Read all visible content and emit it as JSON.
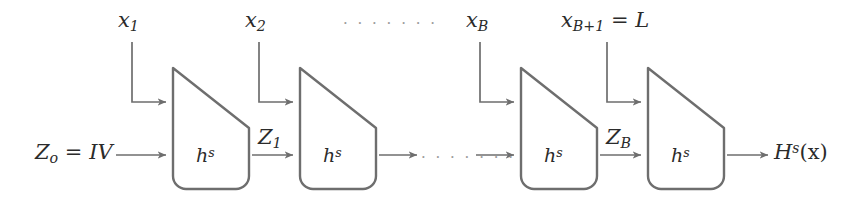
{
  "figure": {
    "background_color": "#ffffff",
    "stroke_color": "#6e6e6e",
    "text_color": "#2b2b2b",
    "dots_color": "#9a9a9a"
  },
  "blocks": [
    {
      "label_base": "h",
      "label_sup": "s"
    },
    {
      "label_base": "h",
      "label_sup": "s"
    },
    {
      "label_base": "h",
      "label_sup": "s"
    },
    {
      "label_base": "h",
      "label_sup": "s"
    }
  ],
  "top_inputs": [
    {
      "base": "x",
      "sub": "1"
    },
    {
      "base": "x",
      "sub": "2"
    },
    {
      "base": "x",
      "sub": "B"
    },
    {
      "base": "x",
      "sub": "B+1",
      "equals": " = ",
      "value": "L"
    }
  ],
  "state_labels": {
    "initial_base": "Z",
    "initial_sub": "o",
    "initial_equals": " = ",
    "initial_value": "IV",
    "z1_base": "Z",
    "z1_sub": "1",
    "zb_base": "Z",
    "zb_sub": "B"
  },
  "output": {
    "base": "H",
    "sup": "s",
    "arg": "(x)"
  },
  "ellipses": {
    "top": "· · · · · · ·",
    "middle": "· · · · · · ·"
  }
}
